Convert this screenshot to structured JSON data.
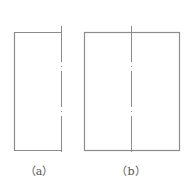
{
  "figures": [
    {
      "id": "a",
      "caption": "（a）",
      "description": "half rectangle bounded by centerline on right"
    },
    {
      "id": "b",
      "caption": "（b）",
      "description": "full rectangle with vertical centerline"
    }
  ],
  "colors": {
    "outline": "#8c8c8c",
    "centerline": "#8c8c8c",
    "background": "#ffffff"
  }
}
